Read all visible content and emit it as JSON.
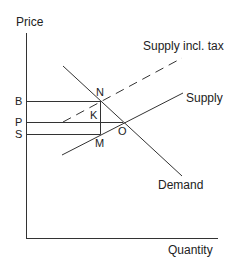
{
  "axes": {
    "y_label": "Price",
    "x_label": "Quantity"
  },
  "price_levels": {
    "B": "B",
    "P": "P",
    "S": "S"
  },
  "points": {
    "N": "N",
    "K": "K",
    "O": "O",
    "M": "M"
  },
  "curves": {
    "supply_tax": "Supply incl. tax",
    "supply": "Supply",
    "demand": "Demand"
  },
  "colors": {
    "line": "#333333",
    "background": "#ffffff"
  }
}
